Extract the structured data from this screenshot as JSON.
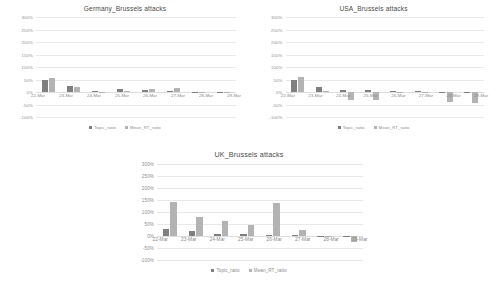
{
  "charts": [
    {
      "id": "germany",
      "title": "Germany_Brussels attacks",
      "legend": {
        "topic": "Topic_ratio",
        "mean": "Mean_RT_ratio"
      },
      "chart_data": {
        "type": "bar",
        "title": "Germany_Brussels attacks",
        "xlabel": "",
        "ylabel": "",
        "ylim": [
          -100,
          300
        ],
        "yticks": [
          "300%",
          "250%",
          "200%",
          "150%",
          "100%",
          "50%",
          "0%",
          "-50%",
          "-100%"
        ],
        "grid": true,
        "legend_position": "bottom",
        "categories": [
          "22-Mar",
          "23-Mar",
          "24-Mar",
          "25-Mar",
          "26-Mar",
          "27-Mar",
          "28-Mar",
          "29-Mar"
        ],
        "series": [
          {
            "name": "Topic_ratio",
            "values": [
              47,
              24,
              6,
              11,
              8,
              5,
              2,
              0
            ]
          },
          {
            "name": "Mean_RT_ratio",
            "values": [
              58,
              20,
              2,
              5,
              14,
              16,
              1,
              0
            ]
          }
        ]
      }
    },
    {
      "id": "usa",
      "title": "USA_Brussels attacks",
      "legend": {
        "topic": "Topic_ratio",
        "mean": "Mean_RT_ratio"
      },
      "chart_data": {
        "type": "bar",
        "title": "USA_Brussels attacks",
        "xlabel": "",
        "ylabel": "",
        "ylim": [
          -100,
          300
        ],
        "yticks": [
          "300%",
          "250%",
          "200%",
          "150%",
          "100%",
          "50%",
          "0%",
          "-50%",
          "-100%"
        ],
        "grid": true,
        "legend_position": "bottom",
        "categories": [
          "22-Mar",
          "23-Mar",
          "24-Mar",
          "25-Mar",
          "26-Mar",
          "27-Mar",
          "28-Mar",
          "29-Mar"
        ],
        "series": [
          {
            "name": "Topic_ratio",
            "values": [
              50,
              20,
              7,
              8,
              6,
              4,
              2,
              1
            ]
          },
          {
            "name": "Mean_RT_ratio",
            "values": [
              62,
              3,
              -32,
              -30,
              -4,
              -2,
              -40,
              -42
            ]
          }
        ]
      }
    },
    {
      "id": "uk",
      "title": "UK_Brussels attacks",
      "legend": {
        "topic": "Topic_ratio",
        "mean": "Mean_RT_ratio"
      },
      "chart_data": {
        "type": "bar",
        "title": "UK_Brussels attacks",
        "xlabel": "",
        "ylabel": "",
        "ylim": [
          -100,
          300
        ],
        "yticks": [
          "300%",
          "250%",
          "200%",
          "150%",
          "100%",
          "50%",
          "0%",
          "-50%",
          "-100%"
        ],
        "grid": true,
        "legend_position": "bottom",
        "categories": [
          "22-Mar",
          "23-Mar",
          "24-Mar",
          "25-Mar",
          "26-Mar",
          "27-Mar",
          "28-Mar",
          "29-Mar"
        ],
        "series": [
          {
            "name": "Topic_ratio",
            "values": [
              30,
              20,
              7,
              7,
              4,
              3,
              1,
              1
            ]
          },
          {
            "name": "Mean_RT_ratio",
            "values": [
              140,
              78,
              62,
              47,
              137,
              27,
              2,
              -25
            ]
          }
        ]
      }
    }
  ],
  "colors": {
    "topic": "#7f7f7f",
    "mean": "#b3b3b3",
    "grid": "#e9e9e9",
    "axis_text": "#8a8a8a",
    "title_text": "#4a4a4a",
    "background": "#ffffff"
  }
}
